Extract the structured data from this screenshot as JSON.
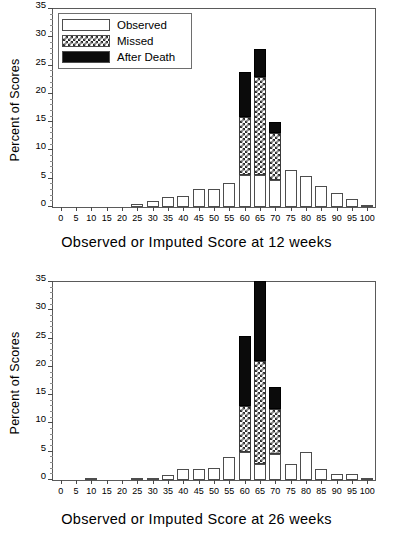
{
  "figure": {
    "ylabel": "Percent of Scores",
    "legend": {
      "items": [
        {
          "label": "Observed",
          "pattern": "white",
          "color": "#ffffff"
        },
        {
          "label": "Missed",
          "pattern": "checkered",
          "color": "#2b2b2b"
        },
        {
          "label": "After Death",
          "pattern": "solid-black",
          "color": "#0b0b0b"
        }
      ]
    }
  },
  "chart_data": [
    {
      "type": "bar",
      "stacked": true,
      "title": "",
      "xlabel": "Observed or Imputed Score at 12 weeks",
      "ylabel": "Percent of Scores",
      "xlim": [
        -2.5,
        102.5
      ],
      "ylim": [
        0,
        35
      ],
      "yticks": [
        0,
        5,
        10,
        15,
        20,
        25,
        30,
        35
      ],
      "xticks": [
        0,
        5,
        10,
        15,
        20,
        25,
        30,
        35,
        40,
        45,
        50,
        55,
        60,
        65,
        70,
        75,
        80,
        85,
        90,
        95,
        100
      ],
      "grid": false,
      "legend_position": "upper-left",
      "categories": [
        0,
        5,
        10,
        15,
        20,
        25,
        30,
        35,
        40,
        45,
        50,
        55,
        60,
        65,
        70,
        75,
        80,
        85,
        90,
        95,
        100
      ],
      "series": [
        {
          "name": "Observed",
          "values": [
            0,
            0,
            0,
            0,
            0,
            0.6,
            1.0,
            1.7,
            2.0,
            3.1,
            3.1,
            4.2,
            5.6,
            5.7,
            4.7,
            6.6,
            5.4,
            3.7,
            2.4,
            1.4,
            0.2
          ]
        },
        {
          "name": "Missed",
          "values": [
            0,
            0,
            0,
            0,
            0,
            0,
            0,
            0,
            0,
            0,
            0,
            0,
            10.4,
            17.3,
            8.3,
            0,
            0,
            0,
            0,
            0,
            0
          ]
        },
        {
          "name": "After Death",
          "values": [
            0,
            0,
            0,
            0,
            0,
            0,
            0,
            0,
            0,
            0,
            0,
            0,
            7.8,
            5.0,
            2.0,
            0,
            0,
            0,
            0,
            0,
            0
          ]
        }
      ],
      "totals": [
        0,
        0,
        0,
        0,
        0,
        0.6,
        1.0,
        1.7,
        2.0,
        3.1,
        3.1,
        4.2,
        23.8,
        28.0,
        15.0,
        6.6,
        5.4,
        3.7,
        2.4,
        1.4,
        0.2
      ]
    },
    {
      "type": "bar",
      "stacked": true,
      "title": "",
      "xlabel": "Observed or Imputed Score at 26 weeks",
      "ylabel": "Percent of Scores",
      "xlim": [
        -2.5,
        102.5
      ],
      "ylim": [
        0,
        35
      ],
      "yticks": [
        0,
        5,
        10,
        15,
        20,
        25,
        30,
        35
      ],
      "xticks": [
        0,
        5,
        10,
        15,
        20,
        25,
        30,
        35,
        40,
        45,
        50,
        55,
        60,
        65,
        70,
        75,
        80,
        85,
        90,
        95,
        100
      ],
      "grid": false,
      "legend_position": "none",
      "categories": [
        0,
        5,
        10,
        15,
        20,
        25,
        30,
        35,
        40,
        45,
        50,
        55,
        60,
        65,
        70,
        75,
        80,
        85,
        90,
        95,
        100
      ],
      "series": [
        {
          "name": "Observed",
          "values": [
            0,
            0,
            0.3,
            0,
            0,
            0.3,
            0.3,
            0.8,
            1.9,
            1.9,
            2.2,
            4.0,
            4.9,
            2.9,
            4.6,
            2.9,
            5.0,
            2.0,
            1.1,
            1.1,
            0.2
          ]
        },
        {
          "name": "Missed",
          "values": [
            0,
            0,
            0,
            0,
            0,
            0,
            0,
            0,
            0,
            0,
            0,
            0,
            8.1,
            18.2,
            8.0,
            0,
            0,
            0,
            0,
            0,
            0
          ]
        },
        {
          "name": "After Death",
          "values": [
            0,
            0,
            0,
            0,
            0,
            0,
            0,
            0,
            0,
            0,
            0,
            0,
            12.5,
            14.0,
            3.9,
            0,
            0,
            0,
            0,
            0,
            0
          ]
        }
      ],
      "totals": [
        0,
        0,
        0.3,
        0,
        0,
        0.3,
        0.3,
        0.8,
        1.9,
        1.9,
        2.2,
        4.0,
        25.5,
        35.1,
        16.5,
        2.9,
        5.0,
        2.0,
        1.1,
        1.1,
        0.2
      ]
    }
  ]
}
